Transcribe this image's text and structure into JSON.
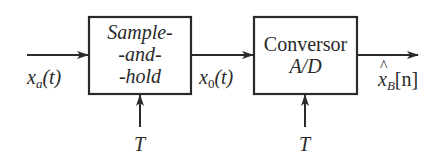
{
  "diagram": {
    "type": "block-diagram",
    "blocks": [
      {
        "id": "sample-and-hold",
        "lines": [
          "Sample-",
          "-and-",
          "-hold"
        ],
        "italic": true
      },
      {
        "id": "ad-converter",
        "lines": [
          "Conversor",
          "A/D"
        ]
      }
    ],
    "signals": {
      "input": {
        "var": "x",
        "sub": "a",
        "arg": "(t)"
      },
      "intermediate": {
        "var": "x",
        "sub": "0",
        "arg": "(t)"
      },
      "output": {
        "var": "x",
        "sub": "B",
        "arg": "[n]",
        "hat": true
      }
    },
    "control_inputs": [
      {
        "block": "sample-and-hold",
        "label": "T"
      },
      {
        "block": "ad-converter",
        "label": "T"
      }
    ],
    "colors": {
      "stroke": "#2a2a2a",
      "background": "#ffffff"
    }
  }
}
